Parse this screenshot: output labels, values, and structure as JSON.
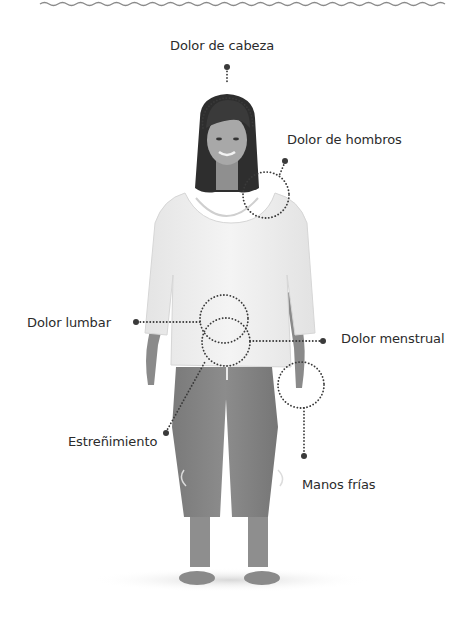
{
  "decor": {
    "wave_color": "#8a8a8a"
  },
  "diagram": {
    "marker_color": "#3a3a3a",
    "labels": {
      "headache": "Dolor de cabeza",
      "shoulder_pain": "Dolor de hombros",
      "lower_back_pain": "Dolor lumbar",
      "menstrual_pain": "Dolor menstrual",
      "constipation": "Estreñimiento",
      "cold_hands": "Manos frías"
    }
  }
}
